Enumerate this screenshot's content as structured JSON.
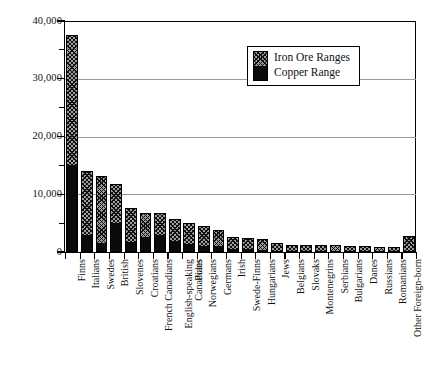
{
  "chart_data": {
    "type": "bar",
    "title": "",
    "xlabel": "",
    "ylabel": "",
    "ylim": [
      0,
      40000
    ],
    "ytick_labels": [
      "0",
      "10,000",
      "20,000",
      "30,000",
      "40,000"
    ],
    "ytick_values": [
      0,
      10000,
      20000,
      30000,
      40000
    ],
    "minor_ytick_values": [
      5000,
      15000,
      25000,
      35000
    ],
    "grid": "horizontal",
    "stacked": true,
    "legend_position": "top-right-inside",
    "categories": [
      "Finns",
      "Italians",
      "Swedes",
      "British",
      "Slovenes",
      "Croatians",
      "French Canadians",
      "English-speaking Canadians",
      "Poles",
      "Norwegians",
      "Germans",
      "Irish",
      "Swede-Finns",
      "Hungarians",
      "Jews",
      "Belgians",
      "Slovaks",
      "Montenegrins",
      "Serbians",
      "Bulgarians",
      "Danes",
      "Russians",
      "Romanians",
      "Other Foreign-born"
    ],
    "series": [
      {
        "name": "Copper Range",
        "swatch": "solid-black",
        "color": "#0a0a0a",
        "values": [
          15000,
          2900,
          1600,
          5100,
          1700,
          2600,
          2900,
          1900,
          1400,
          1100,
          1000,
          600,
          500,
          400,
          200,
          200,
          200,
          150,
          150,
          100,
          100,
          100,
          100,
          200
        ]
      },
      {
        "name": "Iron Ore Ranges",
        "swatch": "hatched",
        "color": "#9d9d9d",
        "values": [
          22600,
          11100,
          11600,
          6700,
          6000,
          4200,
          3900,
          3900,
          3700,
          3400,
          2800,
          2000,
          1900,
          1900,
          1500,
          1300,
          1200,
          1250,
          1200,
          1100,
          1000,
          950,
          900,
          2800
        ]
      }
    ],
    "totals": [
      37600,
      14000,
      13200,
      11800,
      7700,
      6800,
      6800,
      5800,
      5100,
      4500,
      3800,
      2600,
      2400,
      2300,
      1700,
      1500,
      1400,
      1400,
      1350,
      1200,
      1100,
      1050,
      1000,
      3000
    ]
  },
  "legend": {
    "items": [
      {
        "label": "Iron Ore Ranges"
      },
      {
        "label": "Copper Range"
      }
    ]
  },
  "colors": {
    "axis": "#000000",
    "grid": "#9a9a9a",
    "copper": "#0a0a0a",
    "iron": "#9d9d9d",
    "background": "#ffffff"
  }
}
